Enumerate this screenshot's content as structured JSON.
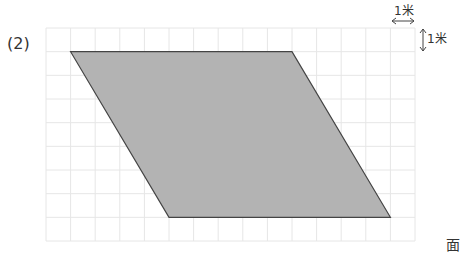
{
  "problem": {
    "label": "(2)"
  },
  "scale": {
    "horizontal_label": "1米",
    "vertical_label": "1米"
  },
  "corner_glyph": "面",
  "grid": {
    "columns": 15,
    "rows": 9,
    "line_color": "#e6e6e6"
  },
  "shape": {
    "type": "parallelogram",
    "vertices_grid_units": [
      [
        1,
        1
      ],
      [
        10,
        1
      ],
      [
        14,
        8
      ],
      [
        5,
        8
      ]
    ],
    "fill": "#b3b3b3",
    "stroke": "#444444"
  }
}
